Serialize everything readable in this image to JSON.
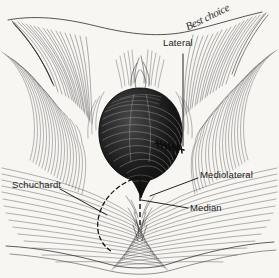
{
  "figure": {
    "kind": "anatomical-line-drawing",
    "background_color": "#f7f6f3",
    "ink_color": "#1b1b1b"
  },
  "labels": {
    "lateral": "Lateral",
    "mediolateral": "Mediolateral",
    "median": "Median",
    "schuchardt": "Schuchardt"
  },
  "annotations": {
    "best_choice": "Best choice"
  },
  "icons": {
    "leader_line": "leader-line",
    "dashed_incision": "dashed-incision-line",
    "hatched_incision": "hatched-incision-line",
    "fetal_head": "fetal-head-shape",
    "perineum": "perineum-hatching"
  }
}
